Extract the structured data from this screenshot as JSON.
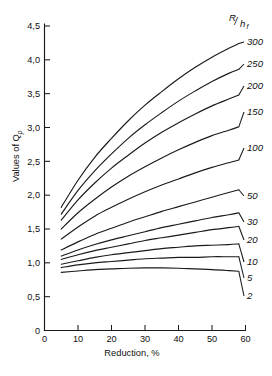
{
  "chart_data": {
    "type": "line",
    "title": "",
    "xlabel": "Reduction, %",
    "ylabel": "Values of Qp",
    "ylabel_main": "Values of Q",
    "ylabel_sub": "p",
    "xlim": [
      0,
      60
    ],
    "ylim": [
      0,
      4.5
    ],
    "xticks": [
      0,
      10,
      20,
      30,
      40,
      50,
      60
    ],
    "xtick_labels": [
      "0",
      "10",
      "20",
      "30",
      "40",
      "50",
      "60"
    ],
    "yticks": [
      0,
      0.5,
      1.0,
      1.5,
      2.0,
      2.5,
      3.0,
      3.5,
      4.0,
      4.5
    ],
    "ytick_labels": [
      "0",
      "0,5",
      "1,0",
      "1,5",
      "2,0",
      "2,5",
      "3,0",
      "3,5",
      "4,0",
      "4,5"
    ],
    "grid": false,
    "legend_position": "right-inline",
    "legend_title_main": "R",
    "legend_title_sub": "h",
    "legend_title_sub2": "f",
    "legend_title_text": "R/hf",
    "line_color": "#1a1a1a",
    "series": [
      {
        "name": "300",
        "label": "300",
        "x": [
          5,
          10,
          15,
          20,
          25,
          30,
          35,
          40,
          45,
          50,
          55,
          58
        ],
        "values": [
          1.82,
          2.22,
          2.56,
          2.84,
          3.1,
          3.33,
          3.53,
          3.72,
          3.89,
          4.04,
          4.17,
          4.24
        ]
      },
      {
        "name": "250",
        "label": "250",
        "x": [
          5,
          10,
          15,
          20,
          25,
          30,
          35,
          40,
          45,
          50,
          55,
          58
        ],
        "values": [
          1.72,
          2.07,
          2.36,
          2.61,
          2.84,
          3.04,
          3.22,
          3.39,
          3.54,
          3.68,
          3.8,
          3.86
        ]
      },
      {
        "name": "200",
        "label": "200",
        "x": [
          5,
          10,
          15,
          20,
          25,
          30,
          35,
          40,
          45,
          50,
          55,
          58
        ],
        "values": [
          1.63,
          1.93,
          2.18,
          2.4,
          2.59,
          2.77,
          2.93,
          3.07,
          3.2,
          3.32,
          3.42,
          3.48
        ]
      },
      {
        "name": "150",
        "label": "150",
        "x": [
          5,
          10,
          15,
          20,
          25,
          30,
          35,
          40,
          45,
          50,
          55,
          58
        ],
        "values": [
          1.5,
          1.74,
          1.94,
          2.12,
          2.28,
          2.42,
          2.55,
          2.67,
          2.78,
          2.88,
          2.96,
          3.01
        ]
      },
      {
        "name": "100",
        "label": "100",
        "x": [
          5,
          10,
          15,
          20,
          25,
          30,
          35,
          40,
          45,
          50,
          55,
          58
        ],
        "values": [
          1.35,
          1.53,
          1.69,
          1.82,
          1.94,
          2.05,
          2.15,
          2.24,
          2.33,
          2.41,
          2.48,
          2.52
        ]
      },
      {
        "name": "50",
        "label": "50",
        "x": [
          5,
          10,
          15,
          20,
          25,
          30,
          35,
          40,
          45,
          50,
          55,
          58
        ],
        "values": [
          1.19,
          1.31,
          1.42,
          1.51,
          1.6,
          1.68,
          1.76,
          1.83,
          1.9,
          1.97,
          2.04,
          2.08
        ]
      },
      {
        "name": "30",
        "label": "30",
        "x": [
          5,
          10,
          15,
          20,
          25,
          30,
          35,
          40,
          45,
          50,
          55,
          58
        ],
        "values": [
          1.1,
          1.19,
          1.27,
          1.34,
          1.4,
          1.46,
          1.52,
          1.57,
          1.62,
          1.67,
          1.71,
          1.74
        ]
      },
      {
        "name": "20",
        "label": "20",
        "x": [
          5,
          10,
          15,
          20,
          25,
          30,
          35,
          40,
          45,
          50,
          55,
          58
        ],
        "values": [
          1.05,
          1.12,
          1.18,
          1.23,
          1.28,
          1.33,
          1.37,
          1.41,
          1.45,
          1.49,
          1.52,
          1.54
        ]
      },
      {
        "name": "10",
        "label": "10",
        "x": [
          5,
          10,
          15,
          20,
          25,
          30,
          35,
          40,
          45,
          50,
          55,
          58
        ],
        "values": [
          0.98,
          1.03,
          1.08,
          1.12,
          1.15,
          1.18,
          1.21,
          1.23,
          1.25,
          1.26,
          1.27,
          1.28
        ]
      },
      {
        "name": "5",
        "label": "5",
        "x": [
          5,
          10,
          15,
          20,
          25,
          30,
          35,
          40,
          45,
          50,
          55,
          58
        ],
        "values": [
          0.93,
          0.97,
          1.0,
          1.02,
          1.04,
          1.06,
          1.07,
          1.08,
          1.08,
          1.09,
          1.09,
          1.09
        ]
      },
      {
        "name": "2",
        "label": "2",
        "x": [
          5,
          10,
          15,
          20,
          25,
          30,
          35,
          40,
          45,
          50,
          55,
          58
        ],
        "values": [
          0.86,
          0.88,
          0.9,
          0.91,
          0.92,
          0.925,
          0.925,
          0.92,
          0.91,
          0.9,
          0.885,
          0.875
        ]
      }
    ]
  }
}
